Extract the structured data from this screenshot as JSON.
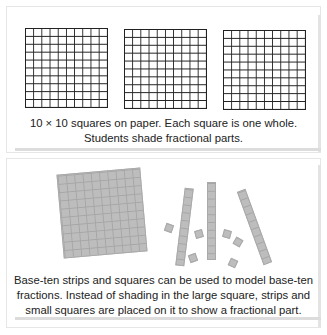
{
  "panels": [
    {
      "id": "paper-grids",
      "grids": [
        {
          "rows": 10,
          "cols": 10,
          "label": "grid-1"
        },
        {
          "rows": 10,
          "cols": 10,
          "label": "grid-2"
        },
        {
          "rows": 10,
          "cols": 10,
          "label": "grid-3"
        }
      ],
      "caption": {
        "line1": "10 × 10 squares on paper. Each square is one whole.",
        "line2": "Students shade fractional parts."
      }
    },
    {
      "id": "base-ten-pieces",
      "pieces": {
        "large_square": {
          "rows": 10,
          "cols": 10
        },
        "strips": 3,
        "small_squares": 6
      },
      "caption": {
        "line1": "Base-ten strips and squares can be used to model base-ten",
        "line2": "fractions. Instead of shading in the large square, strips and",
        "line3": "small squares are placed on it to show a fractional part."
      }
    }
  ],
  "colors": {
    "grid_line": "#222222",
    "piece_fill": "#bdbdbd",
    "piece_line": "#a6a6a6",
    "text": "#222222"
  }
}
